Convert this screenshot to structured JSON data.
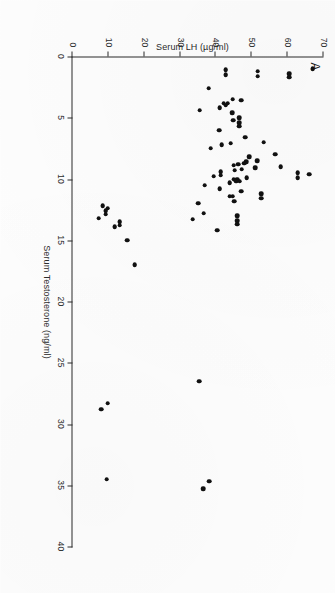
{
  "figure": {
    "panel_label": "A",
    "background_color": "#fdfdfd",
    "marker_color": "#111111",
    "axis_color": "#2b2b2b",
    "rotation_note": "90"
  },
  "chart_data": {
    "type": "scatter",
    "title": "",
    "panel": "A",
    "xlabel": "Serum Testosterone (ng/ml)",
    "ylabel": "Serum LH (µg/ml)",
    "xlim": [
      0,
      40
    ],
    "ylim": [
      0,
      70
    ],
    "xticks": [
      0,
      5,
      10,
      15,
      20,
      25,
      30,
      35,
      40
    ],
    "yticks": [
      0,
      10,
      20,
      30,
      40,
      50,
      60,
      70
    ],
    "xtick_labels": [
      "0",
      "5",
      "10",
      "15",
      "20",
      "25",
      "30",
      "35",
      "40"
    ],
    "ytick_labels": [
      "0",
      "10",
      "20",
      "30",
      "40",
      "50",
      "60",
      "70"
    ],
    "grid": false,
    "legend": false,
    "series": [
      {
        "name": "subjects",
        "marker": "circle",
        "color": "#111111",
        "points": [
          [
            1.0,
            67.0
          ],
          [
            1.4,
            60.4
          ],
          [
            1.7,
            60.4
          ],
          [
            1.2,
            51.6
          ],
          [
            1.6,
            51.6
          ],
          [
            1.1,
            42.7
          ],
          [
            1.5,
            42.7
          ],
          [
            2.6,
            38.0
          ],
          [
            3.5,
            44.6
          ],
          [
            3.8,
            43.2
          ],
          [
            3.8,
            42.2
          ],
          [
            4.0,
            42.8
          ],
          [
            3.6,
            47.0
          ],
          [
            4.2,
            41.0
          ],
          [
            4.4,
            35.5
          ],
          [
            4.6,
            44.5
          ],
          [
            5.0,
            46.5
          ],
          [
            5.4,
            46.5
          ],
          [
            5.7,
            46.5
          ],
          [
            5.2,
            44.8
          ],
          [
            6.0,
            40.9
          ],
          [
            6.6,
            48.2
          ],
          [
            7.0,
            53.3
          ],
          [
            7.1,
            44.1
          ],
          [
            7.2,
            41.6
          ],
          [
            7.5,
            38.6
          ],
          [
            8.0,
            56.5
          ],
          [
            8.2,
            49.3
          ],
          [
            8.5,
            51.5
          ],
          [
            8.6,
            48.4
          ],
          [
            8.7,
            47.9
          ],
          [
            8.8,
            46.2
          ],
          [
            8.9,
            44.9
          ],
          [
            9.0,
            58.0
          ],
          [
            9.1,
            50.9
          ],
          [
            9.2,
            47.2
          ],
          [
            9.3,
            45.2
          ],
          [
            9.4,
            41.4
          ],
          [
            9.7,
            41.4
          ],
          [
            9.5,
            62.8
          ],
          [
            9.9,
            62.8
          ],
          [
            9.6,
            66.0
          ],
          [
            9.8,
            39.3
          ],
          [
            9.9,
            48.6
          ],
          [
            10.0,
            45.9
          ],
          [
            10.0,
            44.9
          ],
          [
            10.2,
            46.6
          ],
          [
            10.2,
            45.6
          ],
          [
            10.3,
            43.8
          ],
          [
            10.5,
            36.9
          ],
          [
            10.8,
            41.1
          ],
          [
            11.0,
            47.0
          ],
          [
            11.2,
            52.6
          ],
          [
            11.6,
            52.6
          ],
          [
            11.4,
            44.7
          ],
          [
            11.4,
            43.9
          ],
          [
            11.8,
            45.1
          ],
          [
            12.0,
            35.1
          ],
          [
            12.2,
            8.4
          ],
          [
            12.4,
            9.8
          ],
          [
            12.6,
            9.3
          ],
          [
            12.9,
            9.3
          ],
          [
            12.8,
            36.6
          ],
          [
            13.0,
            45.9
          ],
          [
            13.4,
            45.9
          ],
          [
            13.7,
            45.9
          ],
          [
            13.2,
            7.3
          ],
          [
            13.3,
            33.5
          ],
          [
            13.5,
            13.1
          ],
          [
            13.8,
            13.1
          ],
          [
            13.9,
            11.7
          ],
          [
            14.2,
            40.3
          ],
          [
            15.0,
            15.2
          ],
          [
            17.0,
            17.3
          ],
          [
            26.5,
            35.3
          ],
          [
            28.3,
            9.8
          ],
          [
            28.8,
            8.0
          ],
          [
            34.5,
            9.5
          ],
          [
            34.7,
            38.1
          ],
          [
            35.3,
            36.4
          ]
        ]
      }
    ]
  }
}
